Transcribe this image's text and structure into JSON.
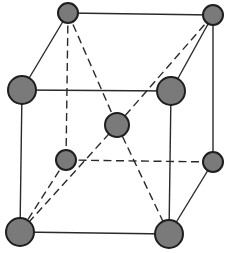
{
  "diagram": {
    "title": "",
    "type": "body-centered unit cell",
    "colors": {
      "background": "#ffffff",
      "line": "#2a2a2a",
      "atom_fill": "#7a7a7a",
      "atom_outline": "#1e1e1e"
    },
    "atoms": [
      {
        "id": "back-top-left",
        "cx": 68,
        "cy": 13,
        "r": 10
      },
      {
        "id": "back-top-right",
        "cx": 213,
        "cy": 15,
        "r": 10
      },
      {
        "id": "back-bottom-left",
        "cx": 66,
        "cy": 160,
        "r": 10
      },
      {
        "id": "back-bottom-right",
        "cx": 213,
        "cy": 162,
        "r": 10
      },
      {
        "id": "body-center",
        "cx": 117,
        "cy": 125,
        "r": 12
      },
      {
        "id": "front-top-left",
        "cx": 22,
        "cy": 90,
        "r": 14
      },
      {
        "id": "front-top-right",
        "cx": 171,
        "cy": 91,
        "r": 14
      },
      {
        "id": "front-bottom-left",
        "cx": 20,
        "cy": 232,
        "r": 14
      },
      {
        "id": "front-bottom-right",
        "cx": 169,
        "cy": 234,
        "r": 14
      }
    ],
    "edges": [
      {
        "from": "back-top-left",
        "to": "back-top-right",
        "style": "solid"
      },
      {
        "from": "back-top-right",
        "to": "back-bottom-right",
        "style": "solid"
      },
      {
        "from": "back-top-left",
        "to": "back-bottom-left",
        "style": "dashed"
      },
      {
        "from": "back-bottom-left",
        "to": "back-bottom-right",
        "style": "dashed"
      },
      {
        "from": "front-top-left",
        "to": "front-top-right",
        "style": "solid"
      },
      {
        "from": "front-top-right",
        "to": "front-bottom-right",
        "style": "solid"
      },
      {
        "from": "front-bottom-left",
        "to": "front-bottom-right",
        "style": "solid"
      },
      {
        "from": "front-top-left",
        "to": "front-bottom-left",
        "style": "solid"
      },
      {
        "from": "back-top-left",
        "to": "front-top-left",
        "style": "solid"
      },
      {
        "from": "back-top-right",
        "to": "front-top-right",
        "style": "solid"
      },
      {
        "from": "back-bottom-right",
        "to": "front-bottom-right",
        "style": "solid"
      },
      {
        "from": "back-bottom-left",
        "to": "front-bottom-left",
        "style": "dashed"
      },
      {
        "from": "back-top-left",
        "to": "body-center",
        "style": "dashed"
      },
      {
        "from": "body-center",
        "to": "front-bottom-right",
        "style": "dashed"
      },
      {
        "from": "front-bottom-left",
        "to": "body-center",
        "style": "dashed"
      },
      {
        "from": "body-center",
        "to": "back-top-right",
        "style": "dashed"
      }
    ]
  }
}
